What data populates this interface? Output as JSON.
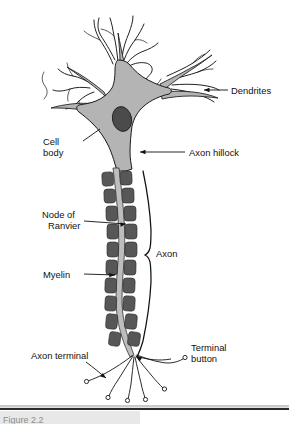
{
  "figure": {
    "background_color": "#ffffff"
  },
  "colors": {
    "soma_fill": "#b4b4b4",
    "nucleus_fill": "#4b4b4b",
    "myelin_fill": "#575757",
    "axon_core_fill": "#bdbdbd",
    "outline": "#151515",
    "label_text": "#111111",
    "caption_text": "#8d8d8d",
    "rule_dark": "#2b2b2b",
    "rule_light": "#c9c9c9"
  },
  "labels": {
    "dendrites": "Dendrites",
    "cell_body_line1": "Cell",
    "cell_body_line2": "body",
    "axon_hillock": "Axon hillock",
    "node_of_ranvier_line1": "Node of",
    "node_of_ranvier_line2": "Ranvier",
    "axon": "Axon",
    "myelin": "Myelin",
    "axon_terminal": "Axon terminal",
    "terminal_button_line1": "Terminal",
    "terminal_button_line2": "button"
  },
  "caption": {
    "text": "Figure  2.2"
  },
  "parts": [
    {
      "name": "dendrites",
      "label": "Dendrites",
      "description": "Branching fibers extending from the cell body that receive incoming signals"
    },
    {
      "name": "cell-body",
      "label": "Cell body",
      "description": "Soma containing the nucleus"
    },
    {
      "name": "axon-hillock",
      "label": "Axon hillock",
      "description": "Junction where the cell body narrows into the axon"
    },
    {
      "name": "node-of-ranvier",
      "label": "Node of Ranvier",
      "description": "Gap between adjacent myelin segments"
    },
    {
      "name": "axon",
      "label": "Axon",
      "description": "Long fiber conducting the nerve impulse"
    },
    {
      "name": "myelin",
      "label": "Myelin",
      "description": "Insulating sheath segments wrapping the axon"
    },
    {
      "name": "axon-terminal",
      "label": "Axon terminal",
      "description": "Branched endings of the axon"
    },
    {
      "name": "terminal-button",
      "label": "Terminal button",
      "description": "Small bulb at the tip of each axon terminal branch"
    }
  ],
  "counts": {
    "myelin_segments": 17,
    "terminal_branches": 6,
    "terminal_buttons": 6
  }
}
